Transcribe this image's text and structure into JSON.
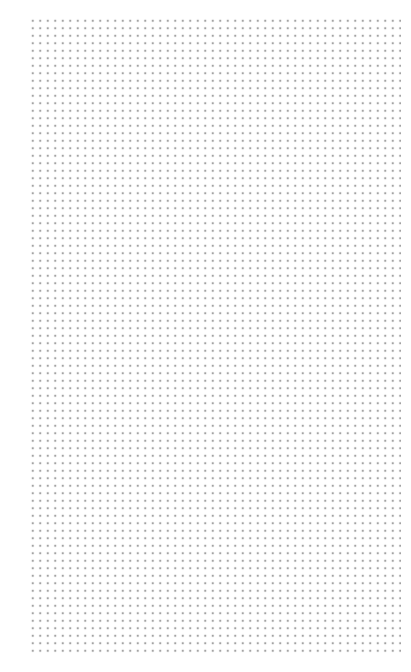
{
  "page": {
    "type": "dot-grid",
    "background_color": "#ffffff",
    "dot_color": "#8a8a8a",
    "grid": {
      "columns": 50,
      "rows": 85,
      "spacing_px": 7.5
    }
  }
}
